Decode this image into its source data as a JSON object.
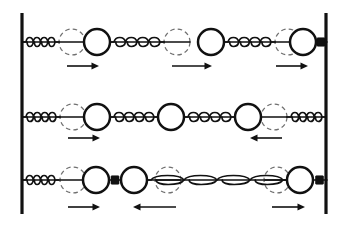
{
  "figure": {
    "width": 343,
    "height": 226,
    "background": "#ffffff",
    "ink_color": "#111111",
    "ghost_color": "#6f6f6f"
  },
  "walls": {
    "left": {
      "x": 22,
      "y_top": 13,
      "y_bottom": 214,
      "thickness": 3.2
    },
    "right": {
      "x": 326,
      "y_top": 13,
      "y_bottom": 214,
      "thickness": 3.2
    }
  },
  "geometry": {
    "mass_radius": 13,
    "ghost_radius": 13,
    "coil_count": 4,
    "coil_radius": 6
  },
  "rows": [
    {
      "name": "mode-1",
      "label": "mode-1",
      "center_y": 42,
      "arrow_y": 66,
      "masses": [
        {
          "name": "mass-1",
          "x": 97,
          "equilibrium_x": 72,
          "direction": "right",
          "has_ghost": true
        },
        {
          "name": "mass-2",
          "x": 211,
          "equilibrium_x": 177,
          "direction": "right",
          "has_ghost": true
        },
        {
          "name": "mass-3",
          "x": 303,
          "equilibrium_x": 288,
          "direction": "right",
          "has_ghost": true
        }
      ],
      "connectors": [
        {
          "name": "spring-wall-to-mass-1",
          "type": "spring",
          "from_x": 22,
          "to_x": 59
        },
        {
          "name": "spring-mass-1-to-mass-2",
          "type": "spring",
          "from_x": 110,
          "to_x": 164
        },
        {
          "name": "spring-mass-2-to-mass-3",
          "type": "spring",
          "from_x": 224,
          "to_x": 275
        },
        {
          "name": "rigid-link-mass-3-to-wall",
          "type": "rigid-link",
          "from_x": 316,
          "to_x": 326
        }
      ],
      "arrows": [
        {
          "name": "displacement-arrow-1",
          "x1": 67,
          "x2": 99,
          "direction": "right"
        },
        {
          "name": "displacement-arrow-2",
          "x1": 172,
          "x2": 212,
          "direction": "right"
        },
        {
          "name": "displacement-arrow-3",
          "x1": 276,
          "x2": 308,
          "direction": "right"
        }
      ]
    },
    {
      "name": "mode-2",
      "label": "mode-2",
      "center_y": 117,
      "arrow_y": 138,
      "masses": [
        {
          "name": "mass-1",
          "x": 97,
          "equilibrium_x": 73,
          "direction": "right",
          "has_ghost": true
        },
        {
          "name": "mass-2",
          "x": 171,
          "equilibrium_x": 171,
          "direction": "none",
          "has_ghost": false
        },
        {
          "name": "mass-3",
          "x": 248,
          "equilibrium_x": 274,
          "direction": "left",
          "has_ghost": true
        }
      ],
      "connectors": [
        {
          "name": "spring-wall-to-mass-1",
          "type": "spring",
          "from_x": 22,
          "to_x": 60
        },
        {
          "name": "spring-mass-1-to-mass-2",
          "type": "spring",
          "from_x": 110,
          "to_x": 158
        },
        {
          "name": "spring-mass-2-to-mass-3",
          "type": "spring",
          "from_x": 184,
          "to_x": 235
        },
        {
          "name": "spring-mass-3-to-wall",
          "type": "spring",
          "from_x": 287,
          "to_x": 326
        }
      ],
      "arrows": [
        {
          "name": "displacement-arrow-1",
          "x1": 68,
          "x2": 100,
          "direction": "right"
        },
        {
          "name": "displacement-arrow-3",
          "x1": 250,
          "x2": 282,
          "direction": "left"
        }
      ]
    },
    {
      "name": "mode-3",
      "label": "mode-3",
      "center_y": 180,
      "arrow_y": 207,
      "masses": [
        {
          "name": "mass-1",
          "x": 96,
          "equilibrium_x": 73,
          "direction": "right",
          "has_ghost": true
        },
        {
          "name": "mass-2",
          "x": 134,
          "equilibrium_x": 168,
          "direction": "left",
          "has_ghost": true
        },
        {
          "name": "mass-3",
          "x": 300,
          "equilibrium_x": 277,
          "direction": "right",
          "has_ghost": true
        }
      ],
      "connectors": [
        {
          "name": "spring-wall-to-mass-1",
          "type": "spring",
          "from_x": 22,
          "to_x": 59
        },
        {
          "name": "rigid-link-mass-1-to-mass-2",
          "type": "rigid-link",
          "from_x": 109,
          "to_x": 121
        },
        {
          "name": "spring-mass-2-to-mass-3",
          "type": "spring",
          "from_x": 147,
          "to_x": 287
        },
        {
          "name": "rigid-link-mass-3-to-wall",
          "type": "rigid-link",
          "from_x": 313,
          "to_x": 326
        }
      ],
      "arrows": [
        {
          "name": "displacement-arrow-1",
          "x1": 68,
          "x2": 100,
          "direction": "right"
        },
        {
          "name": "displacement-arrow-2",
          "x1": 133,
          "x2": 176,
          "direction": "left"
        },
        {
          "name": "displacement-arrow-3",
          "x1": 272,
          "x2": 305,
          "direction": "right"
        }
      ]
    }
  ]
}
